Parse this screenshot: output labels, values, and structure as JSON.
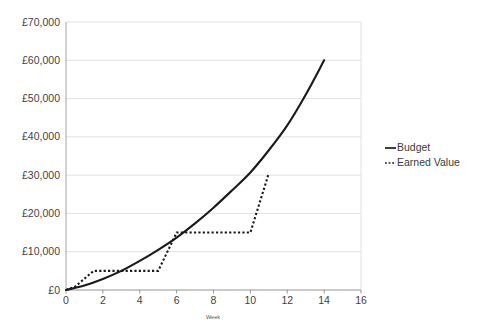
{
  "chart_data": {
    "type": "line",
    "title": "",
    "xlabel": "Week",
    "ylabel": "",
    "xlim": [
      0,
      16
    ],
    "ylim": [
      0,
      70000
    ],
    "grid": true,
    "legend_position": "right",
    "x_ticks": [
      "0",
      "2",
      "4",
      "6",
      "8",
      "10",
      "12",
      "14",
      "16"
    ],
    "x_tick_values": [
      0,
      2,
      4,
      6,
      8,
      10,
      12,
      14,
      16
    ],
    "y_ticks": [
      "£0",
      "£10,000",
      "£20,000",
      "£30,000",
      "£40,000",
      "£50,000",
      "£60,000",
      "£70,000"
    ],
    "y_tick_values": [
      0,
      10000,
      20000,
      30000,
      40000,
      50000,
      60000,
      70000
    ],
    "currency_symbol": "£",
    "series": [
      {
        "name": "Budget",
        "style": "solid",
        "color": "#1a1a1a",
        "x": [
          0,
          1,
          2,
          3,
          4,
          5,
          6,
          7,
          8,
          9,
          10,
          11,
          12,
          13,
          14
        ],
        "values": [
          0,
          1200,
          2900,
          5000,
          7600,
          10500,
          13700,
          17400,
          21500,
          26000,
          30700,
          36500,
          43000,
          51000,
          60000
        ]
      },
      {
        "name": "Earned Value",
        "style": "dotted",
        "color": "#1a1a1a",
        "x": [
          0,
          0.5,
          1.5,
          5,
          6,
          10,
          11
        ],
        "values": [
          0,
          900,
          5000,
          5000,
          15000,
          15000,
          30500
        ]
      }
    ],
    "legend_entries": [
      {
        "label": "Budget",
        "style": "solid"
      },
      {
        "label": "Earned Value",
        "style": "dotted"
      }
    ]
  }
}
